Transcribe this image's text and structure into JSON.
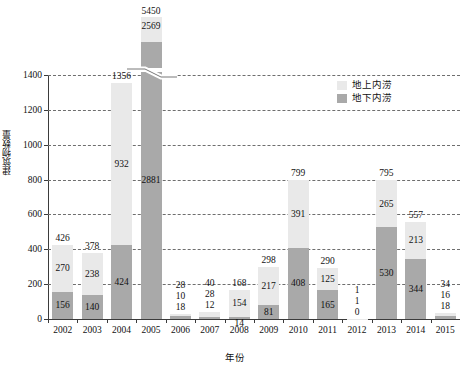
{
  "chart_data": {
    "type": "bar",
    "stacked": true,
    "title": "",
    "xlabel": "年份",
    "ylabel": "建筑物数量",
    "categories": [
      "2002",
      "2003",
      "2004",
      "2005",
      "2006",
      "2007",
      "2008",
      "2009",
      "2010",
      "2011",
      "2012",
      "2013",
      "2014",
      "2015"
    ],
    "series": [
      {
        "name": "地上内涝",
        "color": "#e9e9e9",
        "values": [
          270,
          238,
          932,
          2569,
          10,
          28,
          154,
          217,
          391,
          125,
          1,
          265,
          213,
          16
        ]
      },
      {
        "name": "地下内涝",
        "color": "#a9a9a9",
        "values": [
          156,
          140,
          424,
          2881,
          18,
          12,
          14,
          81,
          408,
          165,
          0,
          530,
          344,
          18
        ]
      }
    ],
    "totals": [
      426,
      378,
      1356,
      5450,
      28,
      40,
      168,
      298,
      799,
      290,
      1,
      795,
      557,
      34
    ],
    "yticks": [
      0,
      200,
      400,
      600,
      800,
      1000,
      1200,
      1400
    ],
    "ylim": [
      0,
      1400
    ],
    "axis_break": true,
    "axis_break_note": "2005 bar exceeds axis; drawn with broken axis above 1400",
    "grid": "horizontal-dashed",
    "legend_position": "upper-right"
  },
  "legend": {
    "items": [
      {
        "label": "地上内涝",
        "color": "#e9e9e9"
      },
      {
        "label": "地下内涝",
        "color": "#a9a9a9"
      }
    ]
  },
  "axes": {
    "y_title": "建筑物数量",
    "x_title": "年份",
    "y_tick_labels": [
      "0",
      "200",
      "400",
      "600",
      "800",
      "1000",
      "1200",
      "1400"
    ],
    "x_tick_labels": [
      "2002",
      "2003",
      "2004",
      "2005",
      "2006",
      "2007",
      "2008",
      "2009",
      "2010",
      "2011",
      "2012",
      "2013",
      "2014",
      "2015"
    ]
  },
  "labels": {
    "totals": [
      "426",
      "378",
      "1356",
      "5450",
      "28",
      "40",
      "168",
      "298",
      "799",
      "290",
      "1",
      "795",
      "557",
      "34"
    ],
    "above": [
      "270",
      "238",
      "932",
      "2569",
      "10",
      "28",
      "154",
      "217",
      "391",
      "125",
      "1",
      "265",
      "213",
      "16"
    ],
    "below": [
      "156",
      "140",
      "424",
      "2881",
      "18",
      "12",
      "14",
      "81",
      "408",
      "165",
      "0",
      "530",
      "344",
      "18"
    ]
  }
}
